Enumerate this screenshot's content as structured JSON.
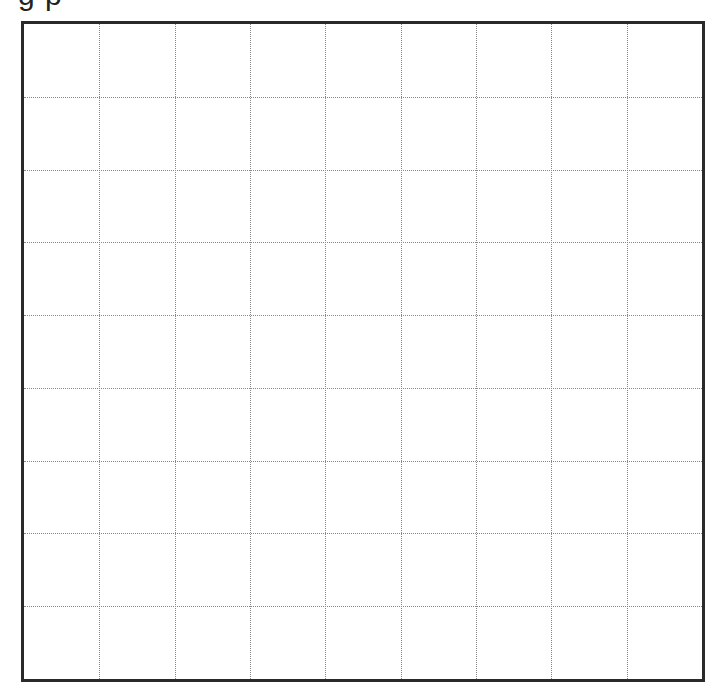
{
  "header": {
    "clipped_title_fragment": "g       p"
  },
  "grid": {
    "columns": 9,
    "rows": 9,
    "border_color": "#2a2a2a",
    "line_color": "#888888",
    "line_style": "dotted",
    "cells_filled": []
  }
}
